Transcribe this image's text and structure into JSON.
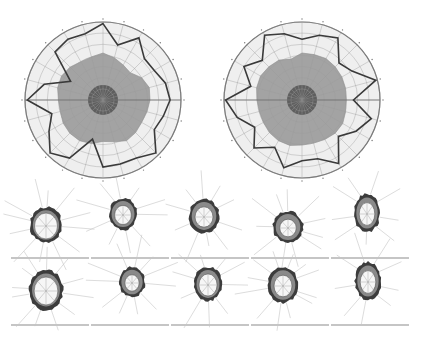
{
  "figure": {
    "width": 422,
    "height": 341,
    "background": "#ffffff"
  },
  "colors": {
    "outer_disc": "#efefef",
    "grid_line": "#9a9a9a",
    "rim": "#6a6a6a",
    "mid_region": "#a3a3a3",
    "inner_core": "#5f5f5f",
    "profile_line": "#3a3a3a",
    "small_ring_dark": "#3c3c3c",
    "small_ring_mid": "#8a8a8a",
    "small_lumen": "#f6f6f6",
    "ray_line": "#c4c4c4",
    "baseline": "#8c8c8c"
  },
  "polar_plots": [
    {
      "id": "left",
      "cx": 103,
      "cy": 100,
      "r": 78,
      "rings": 7,
      "spokes": 24,
      "mid_radius": 47,
      "mid_offsets": [
        1.0,
        0.93,
        0.86,
        0.82,
        0.95,
        1.02,
        1.0,
        0.97,
        0.95,
        0.98,
        1.0,
        0.92,
        0.88,
        0.96,
        1.0,
        1.0,
        0.98,
        0.94,
        0.95,
        1.0,
        1.02,
        0.99,
        0.94,
        0.95
      ],
      "core_radius": 15,
      "profile": [
        0.98,
        0.73,
        0.92,
        0.75,
        0.76,
        0.83,
        0.86,
        0.8,
        0.76,
        0.96,
        0.86,
        0.85,
        0.86,
        0.52,
        0.86,
        0.96,
        0.8,
        0.68,
        0.97,
        0.78,
        0.48,
        0.87,
        0.9,
        0.88
      ]
    },
    {
      "id": "right",
      "cx": 302,
      "cy": 100,
      "r": 78,
      "rings": 7,
      "spokes": 24,
      "mid_radius": 47,
      "mid_offsets": [
        1.0,
        1.0,
        1.02,
        1.0,
        0.98,
        0.96,
        0.94,
        0.96,
        1.0,
        1.0,
        0.97,
        0.95,
        0.96,
        1.0,
        1.0,
        0.98,
        0.95,
        0.94,
        0.96,
        1.0,
        1.02,
        1.0,
        0.98,
        0.9
      ],
      "core_radius": 15,
      "profile": [
        0.78,
        0.86,
        0.92,
        0.67,
        0.74,
        0.98,
        0.66,
        0.92,
        0.8,
        0.66,
        0.94,
        0.78,
        0.78,
        0.9,
        0.7,
        0.87,
        0.7,
        0.86,
        0.98,
        0.68,
        0.86,
        0.72,
        0.96,
        0.88
      ]
    }
  ],
  "small_panels": {
    "rows": [
      {
        "y": 193,
        "baseline_y": 258
      },
      {
        "y": 261,
        "baseline_y": 325
      }
    ],
    "panel_width": 78,
    "panel_gap": 2,
    "first_x": 11,
    "items": [
      {
        "row": 0,
        "col": 0,
        "cx": 46,
        "cy": 225,
        "rx": 16,
        "ry": 18,
        "lumen": 0.72,
        "rays": 12
      },
      {
        "row": 0,
        "col": 1,
        "cx": 123,
        "cy": 214,
        "rx": 14,
        "ry": 16,
        "lumen": 0.6,
        "rays": 10
      },
      {
        "row": 0,
        "col": 2,
        "cx": 204,
        "cy": 216,
        "rx": 15,
        "ry": 17,
        "lumen": 0.6,
        "rays": 10
      },
      {
        "row": 0,
        "col": 3,
        "cx": 288,
        "cy": 227,
        "rx": 15,
        "ry": 16,
        "lumen": 0.55,
        "rays": 11
      },
      {
        "row": 0,
        "col": 4,
        "cx": 367,
        "cy": 213,
        "rx": 13,
        "ry": 19,
        "lumen": 0.6,
        "rays": 9
      },
      {
        "row": 1,
        "col": 0,
        "cx": 46,
        "cy": 290,
        "rx": 17,
        "ry": 20,
        "lumen": 0.7,
        "rays": 12
      },
      {
        "row": 1,
        "col": 1,
        "cx": 132,
        "cy": 282,
        "rx": 13,
        "ry": 15,
        "lumen": 0.55,
        "rays": 11
      },
      {
        "row": 1,
        "col": 2,
        "cx": 208,
        "cy": 284,
        "rx": 14,
        "ry": 17,
        "lumen": 0.65,
        "rays": 10
      },
      {
        "row": 1,
        "col": 3,
        "cx": 283,
        "cy": 285,
        "rx": 15,
        "ry": 18,
        "lumen": 0.6,
        "rays": 12
      },
      {
        "row": 1,
        "col": 4,
        "cx": 368,
        "cy": 281,
        "rx": 13,
        "ry": 19,
        "lumen": 0.6,
        "rays": 9
      }
    ]
  }
}
